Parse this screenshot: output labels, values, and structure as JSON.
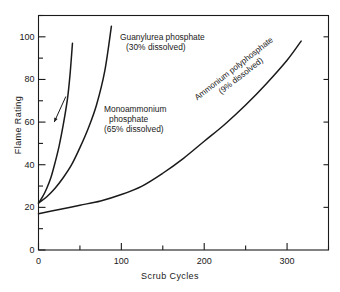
{
  "chart_data": {
    "type": "line",
    "title": "",
    "xlabel": "Scrub Cycles",
    "ylabel": "Flame Rating",
    "xlim": [
      0,
      350
    ],
    "ylim": [
      0,
      110
    ],
    "xticks": [
      0,
      100,
      200,
      300
    ],
    "yticks": [
      0,
      20,
      40,
      60,
      80,
      100
    ],
    "xticklabels": [
      "0",
      "100",
      "200",
      "300"
    ],
    "yticklabels": [
      "0",
      "20",
      "40",
      "60",
      "80",
      "100"
    ],
    "x_minor_tick_interval": 50,
    "y_minor_tick_interval": 10,
    "grid": false,
    "legend": "none (curves labeled inline)",
    "series": [
      {
        "name": "Monoammonium phosphate (65% dissolved)",
        "label_line1": "Monoammonium",
        "label_line2": "phosphate",
        "label_line3": "(65% dissolved)",
        "dissolved_percent": 65,
        "color": "#1a1a1a",
        "points": [
          [
            0,
            22
          ],
          [
            5,
            25
          ],
          [
            10,
            29
          ],
          [
            15,
            34
          ],
          [
            20,
            41
          ],
          [
            25,
            49
          ],
          [
            30,
            59
          ],
          [
            35,
            71
          ],
          [
            38,
            82
          ],
          [
            41,
            97
          ]
        ]
      },
      {
        "name": "Guanylurea phosphate (30% dissolved)",
        "label_line1": "Guanylurea phosphate",
        "label_line2": "(30% dissolved)",
        "dissolved_percent": 30,
        "color": "#1a1a1a",
        "points": [
          [
            0,
            22
          ],
          [
            10,
            25
          ],
          [
            20,
            29
          ],
          [
            30,
            34
          ],
          [
            40,
            40
          ],
          [
            50,
            48
          ],
          [
            60,
            57
          ],
          [
            70,
            68
          ],
          [
            80,
            84
          ],
          [
            88,
            105
          ]
        ]
      },
      {
        "name": "Ammonium polyphosphate (9% dissolved)",
        "label_line1": "Ammonium polyphosphate",
        "label_line2": "(9% dissolved)",
        "dissolved_percent": 9,
        "color": "#1a1a1a",
        "points": [
          [
            0,
            17
          ],
          [
            25,
            19
          ],
          [
            50,
            21
          ],
          [
            75,
            23
          ],
          [
            100,
            26
          ],
          [
            125,
            30
          ],
          [
            150,
            36
          ],
          [
            175,
            43
          ],
          [
            200,
            51
          ],
          [
            225,
            59
          ],
          [
            250,
            68
          ],
          [
            275,
            78
          ],
          [
            300,
            89
          ],
          [
            317,
            98
          ]
        ]
      }
    ],
    "annotations": [
      {
        "name": "monoammonium-leader",
        "type": "arrow",
        "from_xy": [
          33,
          72
        ],
        "to_xy": [
          19,
          60
        ]
      }
    ]
  },
  "axes": {
    "x_title": "Scrub Cycles",
    "y_title": "Flame Rating"
  },
  "colors": {
    "ink": "#1a1a1a",
    "background": "#ffffff"
  }
}
